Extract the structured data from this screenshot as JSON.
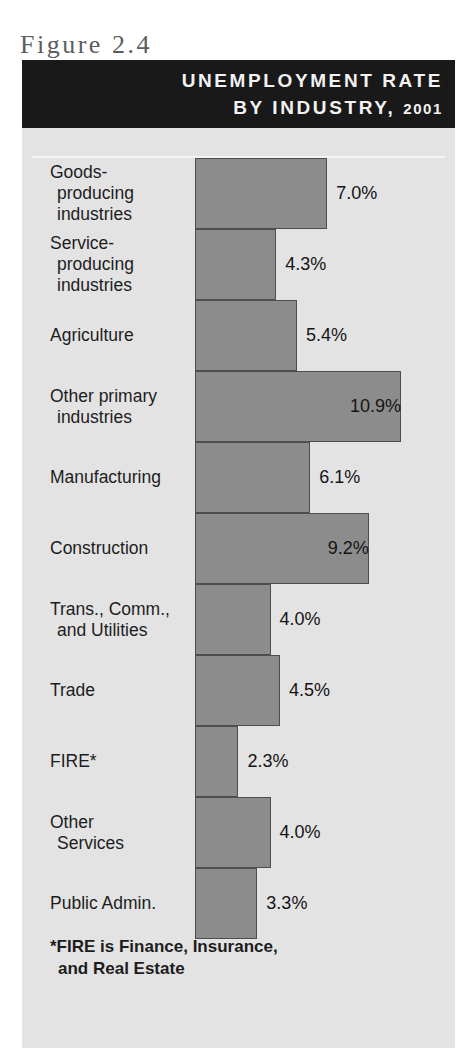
{
  "top_bleed_text": "",
  "figure_label": "Figure 2.4",
  "banner": {
    "line1": "UNEMPLOYMENT RATE",
    "line2_prefix": "BY INDUSTRY,",
    "line2_year": "2001"
  },
  "footnote": {
    "line1": "*FIRE is Finance, Insurance,",
    "line2": "and Real Estate"
  },
  "colors": {
    "banner_background": "#191919",
    "panel_background": "#e3e3e3",
    "bar_fill": "#8c8c8c",
    "bar_border": "#4e4e4e",
    "text": "#1d1d1d",
    "figure_label": "#5d5d5d"
  },
  "chart_data": {
    "type": "bar",
    "orientation": "horizontal",
    "title": "UNEMPLOYMENT RATE BY INDUSTRY, 2001",
    "figure_number": "Figure 2.4",
    "xlabel": "",
    "ylabel": "",
    "xlim": [
      0,
      11.5
    ],
    "grid": false,
    "legend": false,
    "value_suffix": "%",
    "categories": [
      "Goods-producing industries",
      "Service-producing industries",
      "Agriculture",
      "Other primary industries",
      "Manufacturing",
      "Construction",
      "Trans., Comm., and Utilities",
      "Trade",
      "FIRE*",
      "Other Services",
      "Public Admin."
    ],
    "values": [
      7.0,
      4.3,
      5.4,
      10.9,
      6.1,
      9.2,
      4.0,
      4.5,
      2.3,
      4.0,
      3.3
    ],
    "rows": [
      {
        "label_lines": [
          "Goods-",
          "producing",
          "industries"
        ],
        "value": 7.0,
        "value_label": "7.0%",
        "label_position": "outside"
      },
      {
        "label_lines": [
          "Service-",
          "producing",
          "industries"
        ],
        "value": 4.3,
        "value_label": "4.3%",
        "label_position": "outside"
      },
      {
        "label_lines": [
          "Agriculture"
        ],
        "value": 5.4,
        "value_label": "5.4%",
        "label_position": "outside"
      },
      {
        "label_lines": [
          "Other primary",
          "industries"
        ],
        "value": 10.9,
        "value_label": "10.9%",
        "label_position": "inside"
      },
      {
        "label_lines": [
          "Manufacturing"
        ],
        "value": 6.1,
        "value_label": "6.1%",
        "label_position": "outside"
      },
      {
        "label_lines": [
          "Construction"
        ],
        "value": 9.2,
        "value_label": "9.2%",
        "label_position": "inside"
      },
      {
        "label_lines": [
          "Trans., Comm.,",
          "and Utilities"
        ],
        "value": 4.0,
        "value_label": "4.0%",
        "label_position": "outside"
      },
      {
        "label_lines": [
          "Trade"
        ],
        "value": 4.5,
        "value_label": "4.5%",
        "label_position": "outside"
      },
      {
        "label_lines": [
          "FIRE*"
        ],
        "value": 2.3,
        "value_label": "2.3%",
        "label_position": "outside"
      },
      {
        "label_lines": [
          "Other",
          "Services"
        ],
        "value": 4.0,
        "value_label": "4.0%",
        "label_position": "outside"
      },
      {
        "label_lines": [
          "Public Admin."
        ],
        "value": 3.3,
        "value_label": "3.3%",
        "label_position": "outside"
      }
    ]
  }
}
